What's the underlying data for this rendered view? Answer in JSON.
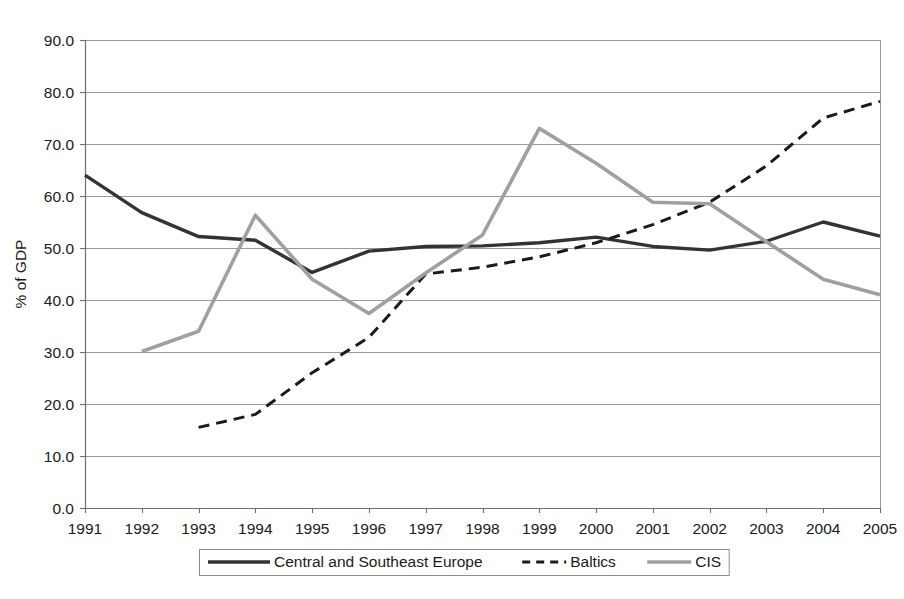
{
  "figure": {
    "y_axis_title": "% of GDP",
    "caption": ""
  },
  "chart_data": {
    "type": "line",
    "title": "",
    "subtitle": "",
    "xlabel": "",
    "ylabel": "% of GDP",
    "x": [
      1991,
      1992,
      1993,
      1994,
      1995,
      1996,
      1997,
      1998,
      1999,
      2000,
      2001,
      2002,
      2003,
      2004,
      2005
    ],
    "xtick_labels": [
      "1991",
      "1992",
      "1993",
      "1994",
      "1995",
      "1996",
      "1997",
      "1998",
      "1999",
      "2000",
      "2001",
      "2002",
      "2003",
      "2004",
      "2005"
    ],
    "ytick_labels": [
      "0.0",
      "10.0",
      "20.0",
      "30.0",
      "40.0",
      "50.0",
      "60.0",
      "70.0",
      "80.0",
      "90.0"
    ],
    "yticks": [
      0,
      10,
      20,
      30,
      40,
      50,
      60,
      70,
      80,
      90
    ],
    "ylim": [
      0,
      90
    ],
    "xlim": [
      1991,
      2005
    ],
    "grid": true,
    "grid_axis": "y",
    "legend_position": "bottom",
    "series": [
      {
        "name": "Central and Southeast Europe",
        "color": "#333333",
        "style": "solid",
        "width": 3.4,
        "x": [
          1991,
          1992,
          1993,
          1994,
          1995,
          1996,
          1997,
          1998,
          1999,
          2000,
          2001,
          2002,
          2003,
          2004,
          2005
        ],
        "values": [
          64.0,
          56.8,
          52.2,
          51.5,
          45.3,
          49.4,
          50.3,
          50.4,
          51.0,
          52.1,
          50.3,
          49.6,
          51.3,
          55.0,
          52.3
        ]
      },
      {
        "name": "Baltics",
        "color": "#1a1a1a",
        "style": "dashed",
        "width": 3.0,
        "x": [
          1993,
          1994,
          1995,
          1996,
          1997,
          1998,
          1999,
          2000,
          2001,
          2002,
          2003,
          2004,
          2005
        ],
        "values": [
          15.5,
          18.0,
          26.0,
          32.8,
          45.0,
          46.3,
          48.3,
          51.0,
          54.5,
          58.8,
          65.8,
          75.0,
          78.2
        ]
      },
      {
        "name": "CIS",
        "color": "#a0a0a0",
        "style": "solid",
        "width": 3.6,
        "x": [
          1992,
          1993,
          1994,
          1995,
          1996,
          1997,
          1998,
          1999,
          2000,
          2001,
          2002,
          2003,
          2004,
          2005
        ],
        "values": [
          30.1,
          34.0,
          56.3,
          44.0,
          37.4,
          45.2,
          52.5,
          73.0,
          66.3,
          58.8,
          58.5,
          51.2,
          44.0,
          41.0
        ]
      }
    ]
  }
}
